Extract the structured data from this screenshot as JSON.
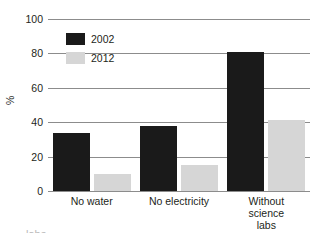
{
  "chart_data": {
    "type": "bar",
    "title": "",
    "xlabel": "",
    "ylabel": "%",
    "ylim": [
      0,
      100
    ],
    "yticks": [
      0,
      20,
      40,
      60,
      80,
      100
    ],
    "grid": true,
    "legend_position": "upper-left-inside",
    "categories": [
      "No water",
      "No electricity",
      "Without science\nlabs"
    ],
    "series": [
      {
        "name": "2002",
        "color": "#1a1a1a",
        "values": [
          34,
          38,
          81
        ]
      },
      {
        "name": "2012",
        "color": "#d6d6d6",
        "values": [
          10,
          15,
          41
        ]
      }
    ]
  },
  "axis": {
    "y_title": "%",
    "tick_labels": [
      "100",
      "80",
      "60",
      "40",
      "20",
      "0"
    ]
  },
  "legend": {
    "entries": [
      {
        "label": "2002",
        "swatch": "black-swatch"
      },
      {
        "label": "2012",
        "swatch": "gray-swatch"
      }
    ]
  },
  "categories": {
    "labels": [
      "No water",
      "No electricity",
      "Without science\nlabs"
    ]
  },
  "caption": {
    "text": "labs"
  }
}
